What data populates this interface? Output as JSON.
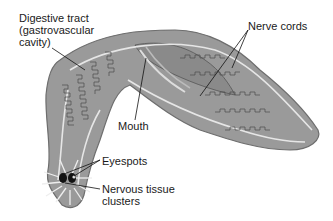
{
  "diagram": {
    "labels": {
      "digestive_line1": "Digestive tract",
      "digestive_line2": "(gastrovascular",
      "digestive_line3": "cavity)",
      "nerve_cords": "Nerve cords",
      "mouth": "Mouth",
      "eyespots": "Eyespots",
      "nervous_line1": "Nervous tissue",
      "nervous_line2": "clusters"
    },
    "colors": {
      "body_fill": "#9a9a9a",
      "body_edge": "#6e6e6e",
      "gut_outline": "#4a4a4a",
      "nerve_cord": "#e6e6e6",
      "text": "#1a1a1a"
    }
  }
}
